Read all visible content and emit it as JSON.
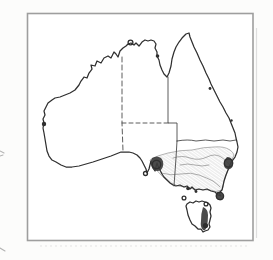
{
  "figure": {
    "kind": "scanned-distribution-map",
    "region": "Australia",
    "features": "hatched southeastern range with dark record blobs and open-circle / filled-dot record markers"
  },
  "colors": {
    "paper": "#fcfcfb",
    "map_bg": "#ffffff",
    "frame": "#9e9e9e",
    "ink": "#2f2f2f",
    "border": "#4a4a4a",
    "hatch": "#c3c3c3",
    "hatch2": "#d6d6d6",
    "range_outline": "#949494",
    "contour": "#8a8a8a",
    "blob": "#3c3c3c",
    "shadow": "#dedede",
    "shadow_dots": "#e3e3e3",
    "artifact": "#b3b3b3"
  },
  "map": {
    "paths": {
      "mainland": "M48,103 L52,100 L55,98 L60,97 L65,95 L70,93 L75,90 L79,85 L81,81 L84,77 L87,78 L89,73 L92,69 L91,65 L95,66 L97,61 L101,63 L104,58 L108,56 L111,58 L114,52 L116,54 L118,57 L120,51 L123,48 L126,46 L128,44 L131,43 L134,45 L136,43 L139,46 L142,42 L145,40 L148,41 L151,40 L154,41 L156,44 L155,48 L157,52 L157,56 L159,60 L160,65 L162,70 L164,74 L167,77 L169,73 L171,66 L172,59 L174,52 L176,47 L179,42 L182,38 L186,34 L189,33 L190,37 L192,42 L194,47 L197,53 L200,60 L203,66 L206,73 L209,79 L211,84 L214,90 L217,96 L220,102 L223,107 L226,113 L229,118 L231,123 L233,128 L235,133 L236,138 L237,142 L238,147 L237,152 L235,157 L232,161 L230,165 L228,170 L226,175 L224,181 L223,186 L222,190 L219,193 L221,196 L218,195 L215,192 L211,191 L207,189 L203,190 L199,189 L195,190 L192,187 L190,189 L187,186 L184,187 L180,185 L176,186 L173,185 L170,183 L167,180 L164,177 L162,174 L160,170 L158,166 L157,163 L156,167 L155,171 L153,168 L152,164 L151,161 L150,165 L149,169 L147,173 L146,169 L144,165 L142,161 L140,158 L137,155 L133,153 L129,152 L125,152 L121,152 L116,154 L111,156 L105,158 L99,160 L93,162 L86,164 L79,166 L72,167 L66,167 L61,165 L56,162 L52,160 L49,156 L47,151 L46,145 L45,139 L44,133 L43,128 L44,123 L43,119 L45,115 L44,111 L46,107 Z",
      "tasmania": "M187,204 L190,202 L193,203 L196,201 L199,202 L202,201 L205,202 L208,203 L210,205 L211,208 L210,212 L211,216 L210,220 L209,224 L210,227 L208,230 L205,231 L203,232 L201,229 L198,229 L195,226 L192,224 L190,220 L188,215 L187,210 L186,206 Z",
      "border_wa": "M122,57 L122,123 L123,151",
      "border_nt_sa": "M122,123 L168,123",
      "border_nt_qld": "M168,77 L168,123 L177,123 L177,141",
      "border_qld_nsw": "M177,141 Q188,139 196,141 Q206,139 214,141 Q224,139 230,141 L236,140",
      "border_sa_vic": "M177,141 L176,158 L174,186",
      "range_outline": "M150,160 Q158,155 168,153 Q180,150 192,150 Q204,147 214,147 Q224,146 230,150 Q233,152 234,155 L231,162 L228,170 L225,178 L223,186 L222,190 Q216,193 210,190 Q202,190 194,189 Q186,187 178,186 Q170,184 164,178 Q158,172 154,167 Q150,163 150,160 Z",
      "contour_a": "M173,158 Q182,155 190,158 Q199,161 207,157 Q215,153 221,157 Q226,160 229,164",
      "contour_b": "M161,173 Q171,176 181,174 Q191,172 199,175 Q207,178 213,181 Q217,184 220,187",
      "contour_c": "M180,165 Q188,163 195,165 Q202,167 209,165",
      "blob_adelaide": "M152,158 Q157,155 161,158 Q164,161 163,166 Q162,171 157,171 Q152,170 151,165 Q150,161 152,158 Z",
      "blob_sydney": "M227,157 Q232,157 233,162 Q234,167 230,169 Q226,170 224,166 Q223,161 227,157 Z",
      "blob_promontory": "M217,192 Q221,191 223,194 Q225,198 222,200 Q218,201 216,198 Q215,194 217,192 Z",
      "blob_tasmania": "M203,207 Q208,209 208,215 Q208,221 207,226 Q206,231 203,230 Q200,227 201,221 Q201,213 203,207 Z",
      "artifact_top": "M0,151 L4,153 M0,156 L3,155",
      "artifact_bottom": "M0,248 L5,251"
    },
    "markers": [
      {
        "name": "darwin-ring",
        "type": "ring",
        "x": 130.5,
        "y": 42.5,
        "r": 2.4
      },
      {
        "name": "gulf-coast-dot",
        "type": "dot",
        "x": 157.5,
        "y": 56,
        "r": 1.8
      },
      {
        "name": "wa-coast-dot",
        "type": "dot",
        "x": 44,
        "y": 124,
        "r": 2.2
      },
      {
        "name": "adelaide-ring",
        "type": "ring",
        "x": 156.5,
        "y": 164.5,
        "r": 4.2
      },
      {
        "name": "kangaroo-island-ring",
        "type": "ring",
        "x": 145.5,
        "y": 173.5,
        "r": 2
      },
      {
        "name": "sydney-ring",
        "type": "ring",
        "x": 228.5,
        "y": 163,
        "r": 4.2
      },
      {
        "name": "promontory-ring",
        "type": "ring",
        "x": 220,
        "y": 196,
        "r": 3.6
      },
      {
        "name": "port-phillip-dot",
        "type": "dot",
        "x": 188,
        "y": 188.5,
        "r": 1.8
      },
      {
        "name": "vic-coast-dot",
        "type": "dot",
        "x": 196,
        "y": 191.5,
        "r": 1.4
      },
      {
        "name": "king-island-ring",
        "type": "ring",
        "x": 184,
        "y": 198,
        "r": 1.9
      },
      {
        "name": "ne-tasmania-ring",
        "type": "ring",
        "x": 206,
        "y": 204,
        "r": 1.9
      },
      {
        "name": "se-tasmania-dot",
        "type": "dot",
        "x": 205.5,
        "y": 225.5,
        "r": 2.6
      },
      {
        "name": "qld-coast-dot",
        "type": "dot",
        "x": 210,
        "y": 88.5,
        "r": 1.4
      },
      {
        "name": "qld-coast-dot-2",
        "type": "dot",
        "x": 231.5,
        "y": 120.5,
        "r": 1.2
      }
    ]
  }
}
